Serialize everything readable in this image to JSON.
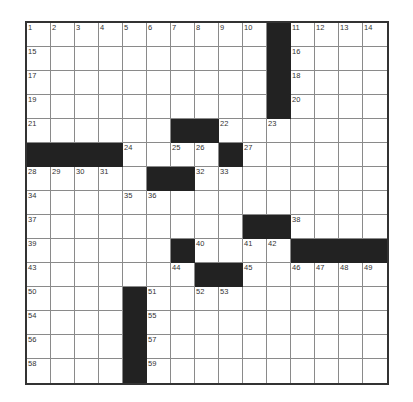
{
  "puzzle": {
    "rows": 15,
    "cols": 15,
    "colors": {
      "block": "#222222",
      "cell": "#ffffff",
      "grid_line": "#8a8a8a",
      "border": "#333333"
    },
    "blocks": [
      [
        0,
        10
      ],
      [
        1,
        10
      ],
      [
        2,
        10
      ],
      [
        3,
        10
      ],
      [
        4,
        6
      ],
      [
        4,
        7
      ],
      [
        5,
        0
      ],
      [
        5,
        1
      ],
      [
        5,
        2
      ],
      [
        5,
        3
      ],
      [
        5,
        8
      ],
      [
        6,
        5
      ],
      [
        6,
        6
      ],
      [
        8,
        9
      ],
      [
        8,
        10
      ],
      [
        9,
        6
      ],
      [
        9,
        11
      ],
      [
        9,
        12
      ],
      [
        9,
        13
      ],
      [
        9,
        14
      ],
      [
        10,
        7
      ],
      [
        10,
        8
      ],
      [
        11,
        4
      ],
      [
        12,
        4
      ],
      [
        13,
        4
      ],
      [
        14,
        4
      ]
    ],
    "numbers": [
      {
        "r": 0,
        "c": 0,
        "n": "1"
      },
      {
        "r": 0,
        "c": 1,
        "n": "2"
      },
      {
        "r": 0,
        "c": 2,
        "n": "3"
      },
      {
        "r": 0,
        "c": 3,
        "n": "4"
      },
      {
        "r": 0,
        "c": 4,
        "n": "5"
      },
      {
        "r": 0,
        "c": 5,
        "n": "6"
      },
      {
        "r": 0,
        "c": 6,
        "n": "7"
      },
      {
        "r": 0,
        "c": 7,
        "n": "8"
      },
      {
        "r": 0,
        "c": 8,
        "n": "9"
      },
      {
        "r": 0,
        "c": 9,
        "n": "10"
      },
      {
        "r": 0,
        "c": 11,
        "n": "11"
      },
      {
        "r": 0,
        "c": 12,
        "n": "12"
      },
      {
        "r": 0,
        "c": 13,
        "n": "13"
      },
      {
        "r": 0,
        "c": 14,
        "n": "14"
      },
      {
        "r": 1,
        "c": 0,
        "n": "15"
      },
      {
        "r": 1,
        "c": 11,
        "n": "16"
      },
      {
        "r": 2,
        "c": 0,
        "n": "17"
      },
      {
        "r": 2,
        "c": 11,
        "n": "18"
      },
      {
        "r": 3,
        "c": 0,
        "n": "19"
      },
      {
        "r": 3,
        "c": 11,
        "n": "20"
      },
      {
        "r": 4,
        "c": 0,
        "n": "21"
      },
      {
        "r": 4,
        "c": 8,
        "n": "22"
      },
      {
        "r": 4,
        "c": 10,
        "n": "23"
      },
      {
        "r": 5,
        "c": 4,
        "n": "24"
      },
      {
        "r": 5,
        "c": 6,
        "n": "25"
      },
      {
        "r": 5,
        "c": 7,
        "n": "26"
      },
      {
        "r": 5,
        "c": 9,
        "n": "27"
      },
      {
        "r": 6,
        "c": 0,
        "n": "28"
      },
      {
        "r": 6,
        "c": 1,
        "n": "29"
      },
      {
        "r": 6,
        "c": 2,
        "n": "30"
      },
      {
        "r": 6,
        "c": 3,
        "n": "31"
      },
      {
        "r": 6,
        "c": 7,
        "n": "32"
      },
      {
        "r": 6,
        "c": 8,
        "n": "33"
      },
      {
        "r": 7,
        "c": 0,
        "n": "34"
      },
      {
        "r": 7,
        "c": 4,
        "n": "35"
      },
      {
        "r": 7,
        "c": 5,
        "n": "36"
      },
      {
        "r": 8,
        "c": 0,
        "n": "37"
      },
      {
        "r": 8,
        "c": 11,
        "n": "38"
      },
      {
        "r": 9,
        "c": 0,
        "n": "39"
      },
      {
        "r": 9,
        "c": 7,
        "n": "40"
      },
      {
        "r": 9,
        "c": 9,
        "n": "41"
      },
      {
        "r": 9,
        "c": 10,
        "n": "42"
      },
      {
        "r": 10,
        "c": 0,
        "n": "43"
      },
      {
        "r": 10,
        "c": 6,
        "n": "44"
      },
      {
        "r": 10,
        "c": 9,
        "n": "45"
      },
      {
        "r": 10,
        "c": 11,
        "n": "46"
      },
      {
        "r": 10,
        "c": 12,
        "n": "47"
      },
      {
        "r": 10,
        "c": 13,
        "n": "48"
      },
      {
        "r": 10,
        "c": 14,
        "n": "49"
      },
      {
        "r": 11,
        "c": 0,
        "n": "50"
      },
      {
        "r": 11,
        "c": 5,
        "n": "51"
      },
      {
        "r": 11,
        "c": 7,
        "n": "52"
      },
      {
        "r": 11,
        "c": 8,
        "n": "53"
      },
      {
        "r": 12,
        "c": 0,
        "n": "54"
      },
      {
        "r": 12,
        "c": 5,
        "n": "55"
      },
      {
        "r": 13,
        "c": 0,
        "n": "56"
      },
      {
        "r": 13,
        "c": 5,
        "n": "57"
      },
      {
        "r": 14,
        "c": 0,
        "n": "58"
      },
      {
        "r": 14,
        "c": 5,
        "n": "59"
      }
    ]
  }
}
